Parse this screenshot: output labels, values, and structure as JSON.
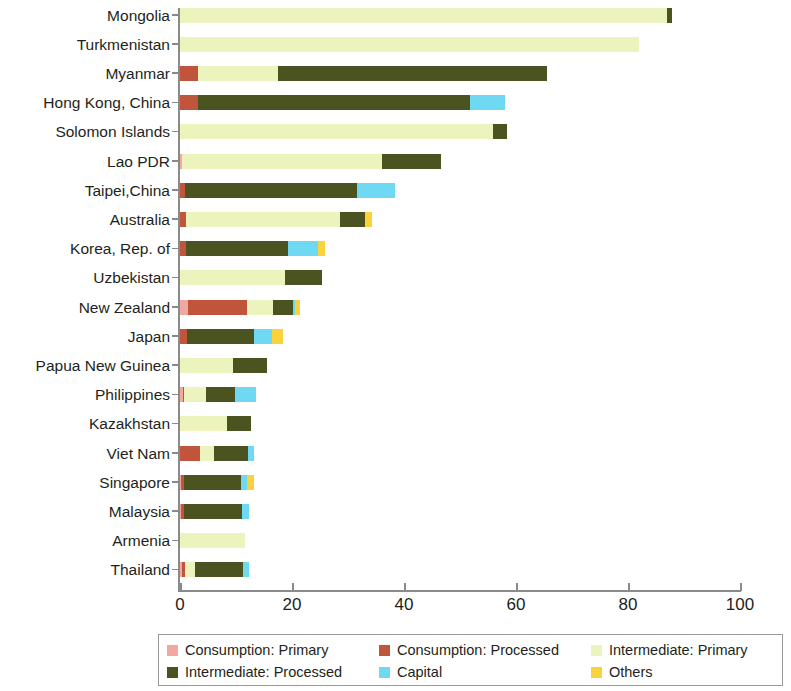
{
  "chart_data": {
    "type": "bar",
    "orientation": "horizontal",
    "stacked": true,
    "title": "",
    "subtitle": "",
    "xlabel": "",
    "ylabel": "",
    "xlim": [
      0,
      100
    ],
    "xticks": [
      0,
      20,
      40,
      60,
      80,
      100
    ],
    "xtick_labels": [
      "0",
      "20",
      "40",
      "60",
      "80",
      "100"
    ],
    "grid": false,
    "legend_position": "bottom",
    "categories": [
      "Mongolia",
      "Turkmenistan",
      "Myanmar",
      "Hong Kong, China",
      "Solomon Islands",
      "Lao PDR",
      "Taipei,China",
      "Australia",
      "Korea, Rep. of",
      "Uzbekistan",
      "New Zealand",
      "Japan",
      "Papua New Guinea",
      "Philippines",
      "Kazakhstan",
      "Viet Nam",
      "Singapore",
      "Malaysia",
      "Armenia",
      "Thailand"
    ],
    "series": [
      {
        "name": "Consumption: Primary",
        "color": "#f0a8a0",
        "values": [
          0.0,
          0.0,
          0.0,
          0.0,
          0.0,
          0.4,
          0.0,
          0.0,
          0.0,
          0.0,
          1.4,
          0.0,
          0.0,
          0.5,
          0.0,
          0.0,
          0.2,
          0.2,
          0.0,
          0.4
        ]
      },
      {
        "name": "Consumption: Processed",
        "color": "#c0553c",
        "values": [
          0.0,
          0.0,
          3.2,
          3.2,
          0.0,
          0.0,
          0.9,
          1.0,
          1.0,
          0.0,
          10.6,
          1.2,
          0.0,
          0.3,
          0.0,
          3.6,
          0.6,
          0.5,
          0.0,
          0.5
        ]
      },
      {
        "name": "Intermediate: Primary",
        "color": "#edf3bd",
        "values": [
          87.0,
          82.0,
          14.3,
          0.0,
          55.9,
          35.6,
          0.0,
          27.6,
          0.0,
          18.8,
          4.6,
          0.0,
          9.5,
          3.8,
          8.4,
          2.4,
          0.0,
          0.0,
          11.6,
          1.7
        ]
      },
      {
        "name": "Intermediate: Processed",
        "color": "#4b5320",
        "values": [
          0.9,
          0.0,
          48.0,
          48.6,
          2.5,
          10.6,
          30.7,
          4.4,
          18.3,
          6.6,
          3.6,
          12.0,
          6.0,
          5.2,
          4.3,
          6.1,
          10.1,
          10.4,
          0.0,
          8.6
        ]
      },
      {
        "name": "Capital",
        "color": "#6fd8f2",
        "values": [
          0.0,
          0.0,
          0.0,
          6.2,
          0.0,
          0.0,
          6.8,
          0.0,
          5.3,
          0.0,
          0.4,
          3.2,
          0.0,
          3.7,
          0.0,
          1.1,
          1.1,
          1.2,
          0.0,
          1.1
        ]
      },
      {
        "name": "Others",
        "color": "#f9d23c",
        "values": [
          0.0,
          0.0,
          0.0,
          0.0,
          0.0,
          0.0,
          0.0,
          1.3,
          1.3,
          0.0,
          0.8,
          2.0,
          0.0,
          0.0,
          0.0,
          0.0,
          1.3,
          0.0,
          0.0,
          0.0
        ]
      }
    ]
  },
  "axis": {
    "tick_labels": [
      "0",
      "20",
      "40",
      "60",
      "80",
      "100"
    ]
  },
  "legend": {
    "items": [
      {
        "label": "Consumption: Primary",
        "color": "#f0a8a0"
      },
      {
        "label": "Consumption: Processed",
        "color": "#c0553c"
      },
      {
        "label": "Intermediate: Primary",
        "color": "#edf3bd"
      },
      {
        "label": "Intermediate: Processed",
        "color": "#4b5320"
      },
      {
        "label": "Capital",
        "color": "#6fd8f2"
      },
      {
        "label": "Others",
        "color": "#f9d23c"
      }
    ]
  }
}
